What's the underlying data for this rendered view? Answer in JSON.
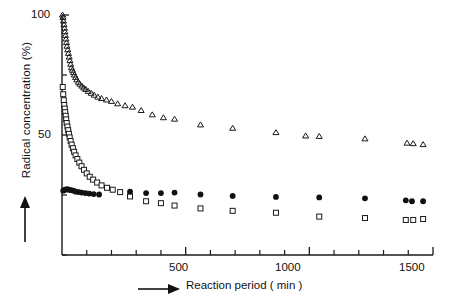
{
  "axes": {
    "y_title": "Radical concentration (%)",
    "x_title": "Reaction period ( min )",
    "y_ticks": [
      "50",
      "100"
    ],
    "x_ticks": [
      "500",
      "1000",
      "1500"
    ],
    "y_arrow_icon": "up-arrow-icon",
    "x_arrow_icon": "right-arrow-icon"
  },
  "chart_data": {
    "type": "scatter",
    "title": "",
    "xlabel": "Reaction period ( min )",
    "ylabel": "Radical concentration (%)",
    "xlim": [
      0,
      1500
    ],
    "ylim": [
      0,
      100
    ],
    "xticks": [
      0,
      500,
      1000,
      1500
    ],
    "xticks_labeled": [
      500,
      1000,
      1500
    ],
    "xminor_step": 100,
    "yticks": [
      50,
      100
    ],
    "yminor": [
      0,
      25,
      50,
      75,
      100
    ],
    "grid": false,
    "legend": "none",
    "marker_colors": {
      "open": "#1a1a1a",
      "filled": "#111111"
    },
    "series": [
      {
        "name": "open-triangle-series",
        "marker": "open-triangle",
        "points": [
          [
            2,
            100
          ],
          [
            4,
            99
          ],
          [
            6,
            97.5
          ],
          [
            8,
            96
          ],
          [
            10,
            94.5
          ],
          [
            12,
            93
          ],
          [
            14,
            91.5
          ],
          [
            16,
            90
          ],
          [
            18,
            88.5
          ],
          [
            20,
            87
          ],
          [
            23,
            85.5
          ],
          [
            26,
            84
          ],
          [
            29,
            82.5
          ],
          [
            32,
            81
          ],
          [
            35,
            79.5
          ],
          [
            38,
            78
          ],
          [
            42,
            77
          ],
          [
            46,
            76
          ],
          [
            50,
            75
          ],
          [
            55,
            74
          ],
          [
            60,
            73
          ],
          [
            66,
            72
          ],
          [
            72,
            71.2
          ],
          [
            80,
            70.4
          ],
          [
            88,
            69.6
          ],
          [
            96,
            69
          ],
          [
            106,
            68.2
          ],
          [
            118,
            67.4
          ],
          [
            130,
            66.6
          ],
          [
            145,
            65.8
          ],
          [
            160,
            65.2
          ],
          [
            180,
            64.6
          ],
          [
            200,
            64
          ],
          [
            225,
            63
          ],
          [
            255,
            62.2
          ],
          [
            285,
            61.6
          ],
          [
            320,
            60.2
          ],
          [
            365,
            58.4
          ],
          [
            410,
            57.2
          ],
          [
            455,
            56.6
          ],
          [
            560,
            54.2
          ],
          [
            690,
            52.8
          ],
          [
            865,
            51
          ],
          [
            985,
            49.6
          ],
          [
            1040,
            49.4
          ],
          [
            1225,
            48.4
          ],
          [
            1395,
            46.6
          ],
          [
            1420,
            46.4
          ],
          [
            1460,
            46
          ]
        ]
      },
      {
        "name": "filled-circle-series",
        "marker": "filled-circle",
        "points": [
          [
            5,
            26.8
          ],
          [
            12,
            27.2
          ],
          [
            20,
            27.4
          ],
          [
            28,
            27.2
          ],
          [
            36,
            27
          ],
          [
            46,
            26.8
          ],
          [
            56,
            26.4
          ],
          [
            68,
            26.2
          ],
          [
            80,
            26
          ],
          [
            95,
            25.8
          ],
          [
            110,
            25.6
          ],
          [
            128,
            25.4
          ],
          [
            150,
            25.2
          ],
          [
            275,
            26.4
          ],
          [
            340,
            25.8
          ],
          [
            400,
            25.8
          ],
          [
            455,
            26
          ],
          [
            560,
            25.2
          ],
          [
            690,
            24.6
          ],
          [
            865,
            24.2
          ],
          [
            1040,
            24
          ],
          [
            1225,
            23.6
          ],
          [
            1390,
            22.8
          ],
          [
            1415,
            22.4
          ],
          [
            1460,
            22.4
          ]
        ]
      },
      {
        "name": "open-square-series",
        "marker": "open-square",
        "points": [
          [
            3,
            70
          ],
          [
            5,
            67
          ],
          [
            7,
            64.5
          ],
          [
            9,
            62.5
          ],
          [
            11,
            61
          ],
          [
            13,
            59.5
          ],
          [
            15,
            58
          ],
          [
            17,
            56.5
          ],
          [
            19,
            55
          ],
          [
            22,
            53.5
          ],
          [
            25,
            52
          ],
          [
            28,
            50.5
          ],
          [
            31,
            49
          ],
          [
            35,
            47.5
          ],
          [
            39,
            46
          ],
          [
            44,
            44.5
          ],
          [
            49,
            43
          ],
          [
            55,
            41.5
          ],
          [
            62,
            40
          ],
          [
            70,
            38.5
          ],
          [
            79,
            37
          ],
          [
            89,
            35.5
          ],
          [
            100,
            34
          ],
          [
            112,
            32.6
          ],
          [
            126,
            31.4
          ],
          [
            142,
            30.2
          ],
          [
            160,
            29
          ],
          [
            182,
            28
          ],
          [
            205,
            27.2
          ],
          [
            235,
            26.2
          ],
          [
            275,
            24.4
          ],
          [
            340,
            22.4
          ],
          [
            400,
            21.6
          ],
          [
            455,
            20.6
          ],
          [
            560,
            19.4
          ],
          [
            690,
            18.4
          ],
          [
            865,
            17.6
          ],
          [
            1040,
            16
          ],
          [
            1225,
            15.4
          ],
          [
            1390,
            14.6
          ],
          [
            1420,
            14.6
          ],
          [
            1460,
            15
          ]
        ]
      }
    ]
  }
}
